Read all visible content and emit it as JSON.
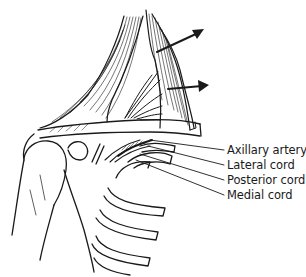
{
  "figure": {
    "labels": [
      {
        "id": "axillary-artery",
        "text": "Axillary artery"
      },
      {
        "id": "lateral-cord",
        "text": "Lateral cord"
      },
      {
        "id": "posterior-cord",
        "text": "Posterior cord"
      },
      {
        "id": "medial-cord",
        "text": "Medial cord"
      }
    ],
    "arrows": [
      {
        "id": "retraction-arrow-upper",
        "direction": "up-right"
      },
      {
        "id": "retraction-arrow-lower",
        "direction": "right"
      }
    ],
    "line_color": "#1a1a1a",
    "background": "#ffffff"
  }
}
